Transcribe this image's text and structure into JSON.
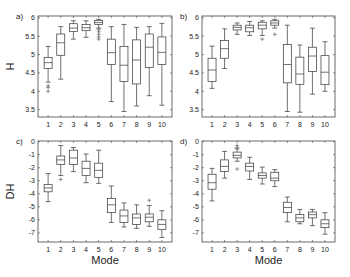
{
  "chart_data": [
    {
      "type": "box",
      "panel": "a)",
      "ylabel": "H",
      "xlabel": "",
      "ylim": [
        3.3,
        6.05
      ],
      "yticks": [
        3.5,
        4,
        4.5,
        5,
        5.5,
        6
      ],
      "ytick_labels": [
        "3.5",
        "4",
        "4.5",
        "5",
        "5.5",
        "6"
      ],
      "categories": [
        "1",
        "2",
        "3",
        "4",
        "5",
        "6",
        "7",
        "8",
        "9",
        "10"
      ],
      "boxes": [
        {
          "min": 4.25,
          "q1": 4.62,
          "median": 4.78,
          "q3": 4.92,
          "max": 5.22,
          "outliers": [
            4.15,
            4.1,
            4.0
          ]
        },
        {
          "min": 4.33,
          "q1": 4.98,
          "median": 5.32,
          "q3": 5.56,
          "max": 5.76,
          "outliers": []
        },
        {
          "min": 5.42,
          "q1": 5.63,
          "median": 5.72,
          "q3": 5.84,
          "max": 5.92,
          "outliers": []
        },
        {
          "min": 5.47,
          "q1": 5.65,
          "median": 5.73,
          "q3": 5.82,
          "max": 5.92,
          "outliers": []
        },
        {
          "min": 5.72,
          "q1": 5.82,
          "median": 5.87,
          "q3": 5.93,
          "max": 5.96,
          "outliers": [
            5.68,
            5.62,
            5.55,
            5.48,
            5.42
          ]
        },
        {
          "min": 3.72,
          "q1": 4.73,
          "median": 5.05,
          "q3": 5.42,
          "max": 5.76,
          "outliers": []
        },
        {
          "min": 3.45,
          "q1": 4.27,
          "median": 4.71,
          "q3": 5.22,
          "max": 5.82,
          "outliers": []
        },
        {
          "min": 3.6,
          "q1": 4.2,
          "median": 4.85,
          "q3": 5.4,
          "max": 5.74,
          "outliers": []
        },
        {
          "min": 3.88,
          "q1": 4.65,
          "median": 5.2,
          "q3": 5.56,
          "max": 5.76,
          "outliers": []
        },
        {
          "min": 3.62,
          "q1": 4.73,
          "median": 5.06,
          "q3": 5.48,
          "max": 5.85,
          "outliers": []
        }
      ]
    },
    {
      "type": "box",
      "panel": "b)",
      "ylabel": "",
      "xlabel": "",
      "ylim": [
        3.3,
        6.05
      ],
      "yticks": [
        3.5,
        4,
        4.5,
        5,
        5.5,
        6
      ],
      "ytick_labels": [
        "3.5",
        "4",
        "4.5",
        "5",
        "5.5",
        "6"
      ],
      "categories": [
        "1",
        "2",
        "3",
        "4",
        "5",
        "6",
        "7",
        "8",
        "9",
        "10"
      ],
      "boxes": [
        {
          "min": 4.08,
          "q1": 4.27,
          "median": 4.58,
          "q3": 4.9,
          "max": 5.23,
          "outliers": []
        },
        {
          "min": 4.62,
          "q1": 4.9,
          "median": 5.16,
          "q3": 5.38,
          "max": 5.7,
          "outliers": []
        },
        {
          "min": 5.55,
          "q1": 5.67,
          "median": 5.74,
          "q3": 5.8,
          "max": 5.86,
          "outliers": []
        },
        {
          "min": 5.52,
          "q1": 5.62,
          "median": 5.73,
          "q3": 5.8,
          "max": 5.9,
          "outliers": []
        },
        {
          "min": 5.52,
          "q1": 5.7,
          "median": 5.8,
          "q3": 5.88,
          "max": 5.92,
          "outliers": [
            5.42
          ]
        },
        {
          "min": 5.72,
          "q1": 5.8,
          "median": 5.86,
          "q3": 5.92,
          "max": 5.96,
          "outliers": [
            5.55
          ]
        },
        {
          "min": 3.45,
          "q1": 4.23,
          "median": 4.73,
          "q3": 5.27,
          "max": 5.8,
          "outliers": []
        },
        {
          "min": 3.43,
          "q1": 4.19,
          "median": 4.47,
          "q3": 4.93,
          "max": 5.26,
          "outliers": []
        },
        {
          "min": 3.92,
          "q1": 4.54,
          "median": 4.96,
          "q3": 5.2,
          "max": 5.72,
          "outliers": []
        },
        {
          "min": 4.0,
          "q1": 4.18,
          "median": 4.52,
          "q3": 4.97,
          "max": 5.35,
          "outliers": []
        }
      ]
    },
    {
      "type": "box",
      "panel": "c)",
      "ylabel": "DH",
      "xlabel": "Mode",
      "ylim": [
        -7.7,
        0.05
      ],
      "yticks": [
        -7,
        -6,
        -5,
        -4,
        -3,
        -2,
        -1,
        0
      ],
      "ytick_labels": [
        "-7",
        "-6",
        "-5",
        "-4",
        "-3",
        "-2",
        "-1",
        "0"
      ],
      "categories": [
        "1",
        "2",
        "3",
        "4",
        "5",
        "6",
        "7",
        "8",
        "9",
        "10"
      ],
      "boxes": [
        {
          "min": -4.6,
          "q1": -3.85,
          "median": -3.55,
          "q3": -3.3,
          "max": -2.45,
          "outliers": []
        },
        {
          "min": -2.6,
          "q1": -1.75,
          "median": -1.4,
          "q3": -1.1,
          "max": -0.3,
          "outliers": [
            -2.9
          ]
        },
        {
          "min": -2.3,
          "q1": -1.75,
          "median": -1.25,
          "q3": -0.65,
          "max": -0.45,
          "outliers": []
        },
        {
          "min": -3.15,
          "q1": -2.6,
          "median": -2.05,
          "q3": -1.5,
          "max": -0.95,
          "outliers": []
        },
        {
          "min": -3.2,
          "q1": -2.75,
          "median": -2.2,
          "q3": -1.65,
          "max": -0.65,
          "outliers": []
        },
        {
          "min": -6.2,
          "q1": -5.45,
          "median": -4.85,
          "q3": -4.35,
          "max": -3.4,
          "outliers": []
        },
        {
          "min": -6.55,
          "q1": -6.2,
          "median": -5.7,
          "q3": -5.25,
          "max": -4.7,
          "outliers": []
        },
        {
          "min": -6.65,
          "q1": -6.35,
          "median": -5.85,
          "q3": -5.55,
          "max": -4.85,
          "outliers": []
        },
        {
          "min": -6.5,
          "q1": -6.15,
          "median": -5.8,
          "q3": -5.55,
          "max": -4.9,
          "outliers": [
            -4.5
          ]
        },
        {
          "min": -7.35,
          "q1": -6.75,
          "median": -6.35,
          "q3": -6.0,
          "max": -5.3,
          "outliers": []
        }
      ]
    },
    {
      "type": "box",
      "panel": "d)",
      "ylabel": "",
      "xlabel": "Mode",
      "ylim": [
        -7.7,
        0.05
      ],
      "yticks": [
        -7,
        -6,
        -5,
        -4,
        -3,
        -2,
        -1,
        0
      ],
      "ytick_labels": [
        "-7",
        "-6",
        "-5",
        "-4",
        "-3",
        "-2",
        "-1",
        "0"
      ],
      "categories": [
        "1",
        "2",
        "3",
        "4",
        "5",
        "6",
        "7",
        "8",
        "9",
        "10"
      ],
      "boxes": [
        {
          "min": -4.55,
          "q1": -3.65,
          "median": -3.15,
          "q3": -2.5,
          "max": -2.05,
          "outliers": []
        },
        {
          "min": -2.8,
          "q1": -2.3,
          "median": -1.9,
          "q3": -1.4,
          "max": -0.75,
          "outliers": []
        },
        {
          "min": -1.5,
          "q1": -1.25,
          "median": -1.05,
          "q3": -0.8,
          "max": -0.55,
          "outliers": [
            -0.45,
            -0.3,
            -2.1
          ]
        },
        {
          "min": -2.9,
          "q1": -2.25,
          "median": -1.9,
          "q3": -1.65,
          "max": -1.2,
          "outliers": []
        },
        {
          "min": -3.25,
          "q1": -2.8,
          "median": -2.6,
          "q3": -2.4,
          "max": -1.95,
          "outliers": []
        },
        {
          "min": -3.45,
          "q1": -3.0,
          "median": -2.8,
          "q3": -2.35,
          "max": -2.15,
          "outliers": []
        },
        {
          "min": -6.15,
          "q1": -5.45,
          "median": -5.05,
          "q3": -4.65,
          "max": -4.25,
          "outliers": []
        },
        {
          "min": -6.3,
          "q1": -6.15,
          "median": -5.85,
          "q3": -5.6,
          "max": -5.2,
          "outliers": []
        },
        {
          "min": -6.45,
          "q1": -5.85,
          "median": -5.6,
          "q3": -5.4,
          "max": -5.2,
          "outliers": []
        },
        {
          "min": -7.1,
          "q1": -6.6,
          "median": -6.3,
          "q3": -6.0,
          "max": -5.45,
          "outliers": []
        }
      ]
    }
  ],
  "layout": {
    "panels": [
      {
        "left": 38,
        "top": 16,
        "right": 172,
        "bottom": 117
      },
      {
        "left": 202,
        "top": 16,
        "right": 335,
        "bottom": 117
      },
      {
        "left": 38,
        "top": 141,
        "right": 172,
        "bottom": 242
      },
      {
        "left": 202,
        "top": 141,
        "right": 335,
        "bottom": 242
      }
    ]
  }
}
